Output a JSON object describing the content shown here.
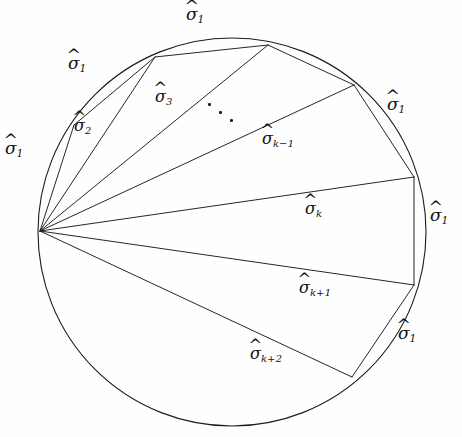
{
  "figure": {
    "type": "geometry-diagram",
    "width": 462,
    "height": 437,
    "background_color": "#fefefe",
    "stroke_color": "#1a1a1a",
    "text_color": "#111111"
  },
  "circle": {
    "center_x": 232,
    "center_y": 232,
    "radius": 194,
    "stroke_width": 1.1
  },
  "hub": {
    "name": "hub-vertex",
    "x": 40,
    "y": 231
  },
  "vertices": [
    {
      "id": "v1",
      "x": 74,
      "y": 125
    },
    {
      "id": "v2",
      "x": 155,
      "y": 57
    },
    {
      "id": "v3",
      "x": 268,
      "y": 45
    },
    {
      "id": "v4",
      "x": 354,
      "y": 85
    },
    {
      "id": "v5",
      "x": 414,
      "y": 177
    },
    {
      "id": "v6",
      "x": 414,
      "y": 285
    },
    {
      "id": "v7",
      "x": 352,
      "y": 377
    }
  ],
  "chords": [
    {
      "id": "chord-1",
      "from": "hub",
      "to": "v1"
    },
    {
      "id": "chord-2",
      "from": "hub",
      "to": "v2"
    },
    {
      "id": "chord-3",
      "from": "hub",
      "to": "v3"
    },
    {
      "id": "chord-4",
      "from": "hub",
      "to": "v4"
    },
    {
      "id": "chord-5",
      "from": "hub",
      "to": "v5"
    },
    {
      "id": "chord-6",
      "from": "hub",
      "to": "v6"
    },
    {
      "id": "chord-7",
      "from": "hub",
      "to": "v7"
    }
  ],
  "boundary_edges": [
    {
      "id": "edge-v1-v2",
      "from": "v1",
      "to": "v2"
    },
    {
      "id": "edge-v2-v3",
      "from": "v2",
      "to": "v3"
    },
    {
      "id": "edge-v3-v4",
      "from": "v3",
      "to": "v4"
    },
    {
      "id": "edge-v4-v5",
      "from": "v4",
      "to": "v5"
    },
    {
      "id": "edge-v5-v6",
      "from": "v5",
      "to": "v6"
    },
    {
      "id": "edge-v6-v7",
      "from": "v6",
      "to": "v7"
    }
  ],
  "labels": {
    "sigma_glyph": "σ",
    "hat_glyph": "^",
    "arcs": [
      {
        "name": "arc-label-left",
        "base": "σ",
        "sub": "1",
        "x": 5,
        "y": 140,
        "size": "size-m"
      },
      {
        "name": "arc-label-upper-left",
        "base": "σ",
        "sub": "1",
        "x": 68,
        "y": 55,
        "size": "size-m"
      },
      {
        "name": "arc-label-top",
        "base": "σ",
        "sub": "1",
        "x": 186,
        "y": 6,
        "size": "size-m"
      },
      {
        "name": "arc-label-upper-right",
        "base": "σ",
        "sub": "1",
        "x": 387,
        "y": 96,
        "size": "size-m"
      },
      {
        "name": "arc-label-right",
        "base": "σ",
        "sub": "1",
        "x": 430,
        "y": 207,
        "size": "size-m"
      },
      {
        "name": "arc-label-lower-right",
        "base": "σ",
        "sub": "1",
        "x": 398,
        "y": 325,
        "size": "size-m"
      }
    ],
    "chords": [
      {
        "name": "chord-label-sigma-2",
        "base": "σ",
        "sub": "2",
        "x": 74,
        "y": 118,
        "size": "size-s"
      },
      {
        "name": "chord-label-sigma-3",
        "base": "σ",
        "sub": "3",
        "x": 155,
        "y": 89,
        "size": "size-s"
      },
      {
        "name": "chord-label-sigma-k-1",
        "base": "σ",
        "sub": "k−1",
        "x": 262,
        "y": 131,
        "size": "size-s"
      },
      {
        "name": "chord-label-sigma-k",
        "base": "σ",
        "sub": "k",
        "x": 305,
        "y": 201,
        "size": "size-s"
      },
      {
        "name": "chord-label-sigma-k+1",
        "base": "σ",
        "sub": "k+1",
        "x": 299,
        "y": 280,
        "size": "size-s"
      },
      {
        "name": "chord-label-sigma-k+2",
        "base": "σ",
        "sub": "k+2",
        "x": 250,
        "y": 346,
        "size": "size-s"
      }
    ],
    "ellipsis": {
      "name": "ellipsis-dots",
      "dots": [
        {
          "x": 208,
          "y": 103
        },
        {
          "x": 219,
          "y": 111
        },
        {
          "x": 230,
          "y": 119
        }
      ]
    }
  }
}
